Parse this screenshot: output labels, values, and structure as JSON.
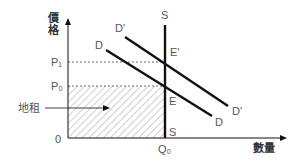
{
  "diagram": {
    "title": "",
    "axes": {
      "y_label_line1": "價",
      "y_label_line2": "格",
      "x_label": "數量",
      "origin": "0"
    },
    "price_levels": {
      "p1": "P₁",
      "p0": "P₀"
    },
    "quantity_levels": {
      "q0": "Q₀"
    },
    "curves": {
      "supply_top": "S",
      "supply_bottom": "S",
      "demand_start": "D",
      "demand_end": "D",
      "demand_new_start": "D'",
      "demand_new_end": "D'"
    },
    "points": {
      "e": "E",
      "e_prime": "E'"
    },
    "annotation": {
      "rent_label": "地租"
    },
    "colors": {
      "line": "#111111",
      "text": "#555555",
      "hatch": "#888888"
    }
  }
}
